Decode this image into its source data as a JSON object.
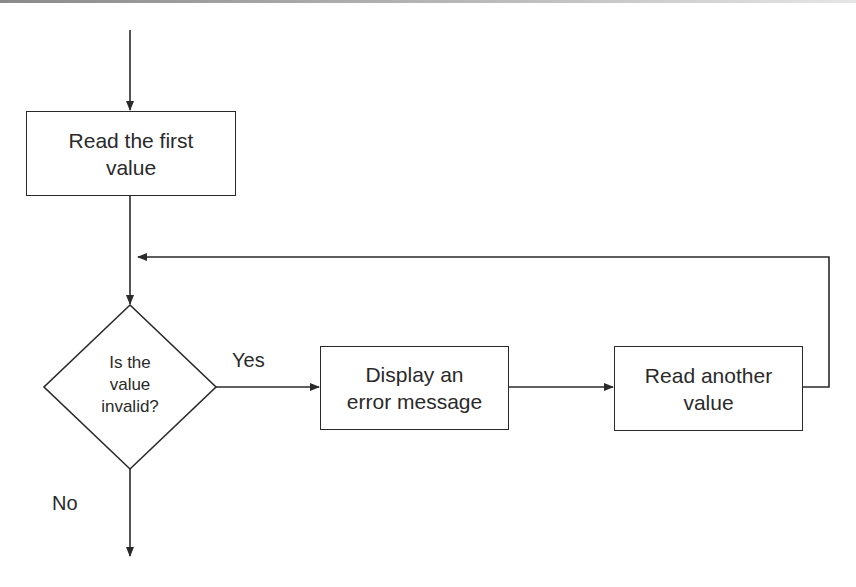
{
  "diagram": {
    "type": "flowchart",
    "nodes": {
      "read_first": {
        "label_line1": "Read the first",
        "label_line2": "value",
        "shape": "rectangle"
      },
      "decision": {
        "label_line1": "Is the",
        "label_line2": "value",
        "label_line3": "invalid?",
        "shape": "diamond"
      },
      "display_error": {
        "label_line1": "Display an",
        "label_line2": "error message",
        "shape": "rectangle"
      },
      "read_another": {
        "label_line1": "Read another",
        "label_line2": "value",
        "shape": "rectangle"
      }
    },
    "edge_labels": {
      "yes": "Yes",
      "no": "No"
    },
    "edges": [
      {
        "from": "start",
        "to": "read_first"
      },
      {
        "from": "read_first",
        "to": "decision"
      },
      {
        "from": "decision",
        "to": "display_error",
        "label": "Yes"
      },
      {
        "from": "display_error",
        "to": "read_another"
      },
      {
        "from": "read_another",
        "to": "decision",
        "route": "loop-back"
      },
      {
        "from": "decision",
        "to": "exit",
        "label": "No"
      }
    ],
    "colors": {
      "stroke": "#2a2a2a",
      "background": "#ffffff"
    }
  }
}
